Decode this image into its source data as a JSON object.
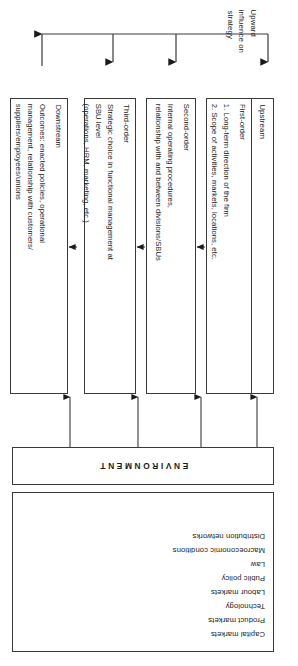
{
  "figure": {
    "orientation_note": "rotated-180",
    "environment": {
      "band_label": "ENVIRONMENT",
      "factors": [
        "Capital markets",
        "Product markets",
        "Technology",
        "Labour markets",
        "Public policy",
        "Law",
        "Macroeconomic conditions",
        "Distribution networks"
      ]
    },
    "order_boxes": [
      {
        "stream": "Upstream",
        "level": "First-order",
        "description": "1. Long-term direction of the firm\n2. Scope of activities, markets, locations, etc.",
        "description_lines": [
          "1. Long-term direction of the firm",
          "2. Scope of activities, markets, locations, etc."
        ]
      },
      {
        "stream": "",
        "level": "Second-order",
        "description": "Internal operating procedures, relationship with and between divisions/SBUs",
        "description_lines": [
          "Internal operating procedures,",
          "relationship with and between divisions/SBUs"
        ]
      },
      {
        "stream": "",
        "level": "Third-order",
        "description": "Strategic choice in functional management at SBU level (operations, HRM, marketing, etc.)",
        "description_lines": [
          "Strategic choice in functional management at",
          "SBU level",
          "(operations, HRM, marketing, etc.)"
        ]
      },
      {
        "stream": "",
        "level": "Downstream",
        "description": "Outcomes: enacted policies, operational management, relationship with customers/ suppliers/employees/unions",
        "description_lines": [
          "Outcomes: enacted policies, operational",
          "management, relationship with customers/",
          "suppliers/employees/unions"
        ]
      }
    ],
    "feedback": {
      "label_lines": [
        "Upward",
        "influence on",
        "strategy"
      ],
      "label": "Upward influence on strategy"
    },
    "colors": {
      "stroke": "#3a3a3a",
      "text": "#1a1a1a",
      "background": "#ffffff"
    }
  }
}
